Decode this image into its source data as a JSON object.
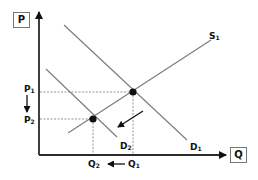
{
  "diagram": {
    "title": "",
    "type": "supply-demand",
    "axes": {
      "y_label": "P",
      "x_label": "Q"
    },
    "curves": [
      {
        "name": "S1",
        "label": "S",
        "sub": "1",
        "kind": "supply"
      },
      {
        "name": "D1",
        "label": "D",
        "sub": "1",
        "kind": "demand"
      },
      {
        "name": "D2",
        "label": "D",
        "sub": "2",
        "kind": "demand"
      }
    ],
    "price_labels": [
      {
        "label": "P",
        "sub": "1"
      },
      {
        "label": "P",
        "sub": "2"
      }
    ],
    "quantity_labels": [
      {
        "label": "Q",
        "sub": "1"
      },
      {
        "label": "Q",
        "sub": "2"
      }
    ],
    "equilibria": [
      {
        "name": "E1",
        "between": "S1-D1",
        "price": "P1",
        "quantity": "Q1"
      },
      {
        "name": "E2",
        "between": "S1-D2",
        "price": "P2",
        "quantity": "Q2"
      }
    ],
    "annotations": [
      {
        "type": "arrow",
        "meaning": "demand shifts left from D1 to D2"
      },
      {
        "type": "arrow",
        "meaning": "price falls from P1 to P2"
      },
      {
        "type": "arrow",
        "meaning": "quantity falls from Q1 to Q2"
      }
    ],
    "colors": {
      "axis": "#2a2a2a",
      "curve": "#7a7a7a",
      "point": "#111111",
      "guide": "#888888"
    }
  }
}
